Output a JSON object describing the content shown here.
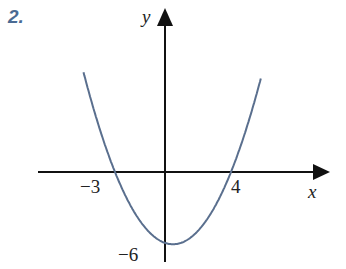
{
  "problem_number": "2.",
  "chart_data": {
    "type": "line",
    "title": "",
    "xlabel": "x",
    "ylabel": "y",
    "function": "y = 0.5(x + 3)(x - 4)",
    "x_intercepts": [
      -3,
      4
    ],
    "y_intercept": -6,
    "tick_labels": {
      "x": [
        "-3",
        "4"
      ],
      "y": [
        "-6"
      ]
    },
    "x": [
      -4.9,
      -3,
      -2,
      -1,
      0,
      0.5,
      1,
      2,
      3,
      4,
      5.8
    ],
    "values": [
      8.6,
      0,
      -3,
      -5,
      -6,
      -6.125,
      -6,
      -5,
      -3,
      0,
      9.2
    ],
    "grid": false,
    "curve_color": "#5a6f8e"
  },
  "labels": {
    "y_axis": "y",
    "x_axis": "x",
    "neg3": "−3",
    "four": "4",
    "neg6": "−6"
  }
}
